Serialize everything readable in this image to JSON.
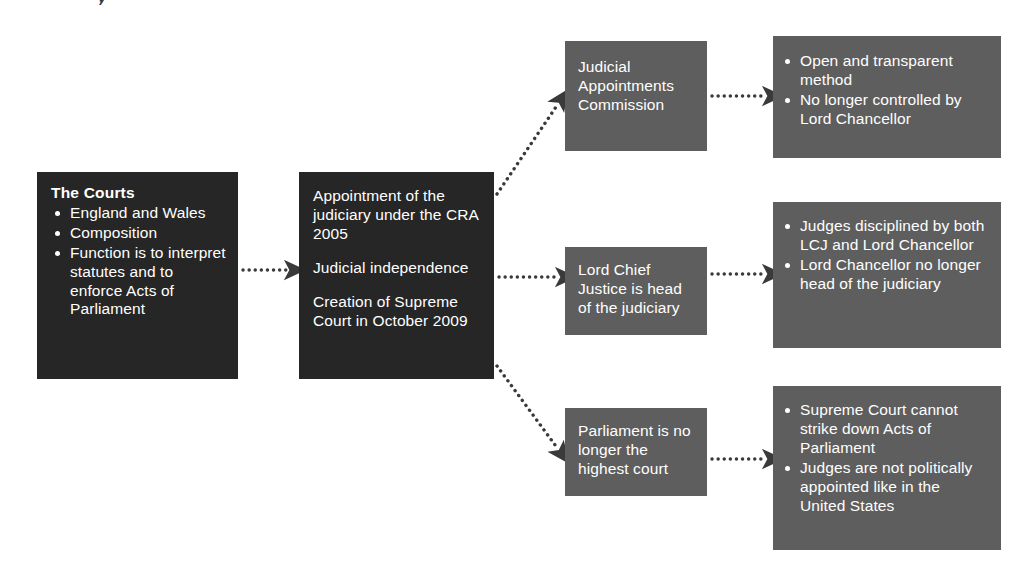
{
  "diagram": {
    "title_fragment": "y",
    "colors": {
      "dark_box": "#262626",
      "grey_box": "#5e5e5e",
      "text": "#ffffff",
      "background": "#ffffff",
      "connector": "#3a3a3a"
    },
    "nodes": {
      "courts": {
        "heading": "The Courts",
        "bullets": [
          "England and Wales",
          "Composition",
          "Function is to interpret statutes and to enforce Acts of Parliament"
        ]
      },
      "appointment": {
        "paragraphs": [
          "Appointment of the judiciary under the CRA 2005",
          "Judicial independence",
          "Creation of Supreme Court in October 2009"
        ]
      },
      "jac": {
        "text": "Judicial Appointments Commission"
      },
      "jac_outcomes": {
        "bullets": [
          "Open and transparent method",
          "No longer controlled by Lord Chancellor"
        ]
      },
      "lcj": {
        "text": "Lord Chief Justice is head of the judiciary"
      },
      "lcj_outcomes": {
        "bullets": [
          "Judges disciplined by both LCJ and Lord Chancellor",
          "Lord Chancellor no longer head of the judiciary"
        ]
      },
      "parliament": {
        "text": "Parliament is no longer the highest court"
      },
      "parliament_outcomes": {
        "bullets": [
          "Supreme Court cannot strike down Acts of Parliament",
          "Judges are not politically appointed like in the United States"
        ]
      }
    },
    "connectors": [
      {
        "name": "courts-to-appointment",
        "style": "dotted-arrow",
        "direction": "horizontal"
      },
      {
        "name": "appointment-to-jac",
        "style": "dotted-arrow",
        "direction": "diagonal-up"
      },
      {
        "name": "appointment-to-lcj",
        "style": "dotted-arrow",
        "direction": "horizontal"
      },
      {
        "name": "appointment-to-parliament",
        "style": "dotted-arrow",
        "direction": "diagonal-down"
      },
      {
        "name": "jac-to-outcomes",
        "style": "dotted-arrow",
        "direction": "horizontal"
      },
      {
        "name": "lcj-to-outcomes",
        "style": "dotted-arrow",
        "direction": "horizontal"
      },
      {
        "name": "parliament-to-outcomes",
        "style": "dotted-arrow",
        "direction": "horizontal"
      }
    ]
  }
}
